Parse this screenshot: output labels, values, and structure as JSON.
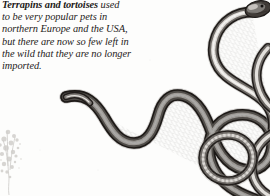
{
  "page": {
    "background_color": "#fdfdfc",
    "width": 270,
    "height": 196
  },
  "caption": {
    "lead_text": "Terrapins and tortoises",
    "lines": [
      " used",
      "to be very popular pets in",
      "northern Europe and the USA,",
      "but there are now so few left in",
      "the wild that they are no longer",
      "imported."
    ],
    "full_text": "Terrapins and tortoises used to be very popular pets in northern Europe and the USA, but there are now so few left in the wild that they are no longer imported.",
    "text_color": "#1d1b19",
    "style": "italic-serif"
  },
  "artwork": {
    "subject": "snake-illustration",
    "description": "Long sinuous grey snake coiling across the right and lower portion of the page, head at top right",
    "ink_dark": "#231f1d",
    "ink_mid": "#6e6a66",
    "ink_light": "#c9c6c2",
    "highlight": "#f2f1ef",
    "foliage": {
      "name": "foliage-sketch",
      "color": "#b9b6b1"
    }
  }
}
